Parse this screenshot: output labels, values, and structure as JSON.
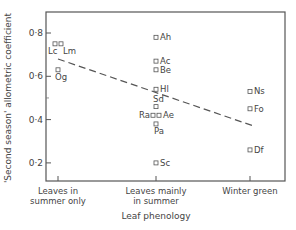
{
  "chart_data": {
    "type": "scatter",
    "title": "",
    "xlabel": "Leaf phenology",
    "ylabel": "'Second season' allometric coefficient",
    "ylim": [
      0.13,
      0.92
    ],
    "yticks": [
      {
        "value": 0.8,
        "label": "0·8"
      },
      {
        "value": 0.6,
        "label": "0·6"
      },
      {
        "value": 0.4,
        "label": "0·4"
      },
      {
        "value": 0.2,
        "label": "0·2"
      }
    ],
    "categories": [
      {
        "id": "summer_only",
        "line1": "Leaves in",
        "line2": "summer only"
      },
      {
        "id": "mainly_summer",
        "line1": "Leaves mainly",
        "line2": "in summer"
      },
      {
        "id": "winter_green",
        "line1": "Winter green",
        "line2": ""
      }
    ],
    "grid": false,
    "legend": null,
    "points": [
      {
        "label": "Lc",
        "category": "summer_only",
        "y": 0.75,
        "dx": -2
      },
      {
        "label": "Lm",
        "category": "summer_only",
        "y": 0.75,
        "dx": 2
      },
      {
        "label": "Og",
        "category": "summer_only",
        "y": 0.63,
        "dx": 0
      },
      {
        "label": "Ah",
        "category": "mainly_summer",
        "y": 0.78,
        "dx": 0
      },
      {
        "label": "Ac",
        "category": "mainly_summer",
        "y": 0.67,
        "dx": 0
      },
      {
        "label": "Be",
        "category": "mainly_summer",
        "y": 0.63,
        "dx": 0
      },
      {
        "label": "Hl",
        "category": "mainly_summer",
        "y": 0.54,
        "dx": 0
      },
      {
        "label": "Sd",
        "category": "mainly_summer",
        "y": 0.46,
        "dx": 0
      },
      {
        "label": "Ra",
        "category": "mainly_summer",
        "y": 0.42,
        "dx": -2
      },
      {
        "label": "Ae",
        "category": "mainly_summer",
        "y": 0.42,
        "dx": 2
      },
      {
        "label": "Pa",
        "category": "mainly_summer",
        "y": 0.38,
        "dx": 0
      },
      {
        "label": "Sc",
        "category": "mainly_summer",
        "y": 0.2,
        "dx": 0
      },
      {
        "label": "Ns",
        "category": "winter_green",
        "y": 0.53,
        "dx": 0
      },
      {
        "label": "Fo",
        "category": "winter_green",
        "y": 0.45,
        "dx": 0
      },
      {
        "label": "Df",
        "category": "winter_green",
        "y": 0.26,
        "dx": 0
      }
    ],
    "trend_line": {
      "style": "dashed",
      "start": {
        "category": "summer_only",
        "y": 0.68
      },
      "end": {
        "category": "winter_green",
        "y": 0.37
      }
    }
  }
}
